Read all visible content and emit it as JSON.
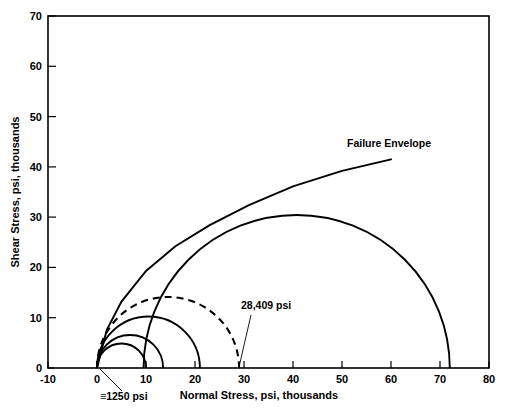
{
  "chart_data": {
    "type": "line",
    "title": "",
    "xlabel": "Normal Stress, psi, thousands",
    "ylabel": "Shear Stress, psi, thousands",
    "xlim": [
      -10,
      80
    ],
    "ylim": [
      0,
      70
    ],
    "xticks": [
      -10,
      0,
      10,
      20,
      30,
      40,
      50,
      60,
      70,
      80
    ],
    "xtick_labels": [
      "-10",
      "0",
      "10",
      "20",
      "30",
      "40",
      "50",
      "60",
      "70",
      "80"
    ],
    "yticks": [
      0,
      10,
      20,
      30,
      40,
      50,
      60,
      70
    ],
    "ytick_labels": [
      "0",
      "10",
      "20",
      "30",
      "40",
      "50",
      "60",
      "70"
    ],
    "grid": false,
    "legend": "none",
    "series": [
      {
        "name": "Mohr circle 1",
        "style": "solid",
        "type": "mohr-circle",
        "sigma_min": 0.0,
        "sigma_max": 10.0,
        "center": 5.0,
        "radius": 5.0
      },
      {
        "name": "Mohr circle 2",
        "style": "solid",
        "type": "mohr-circle",
        "sigma_min": 0.0,
        "sigma_max": 13.5,
        "center": 6.75,
        "radius": 6.75
      },
      {
        "name": "Mohr circle 3",
        "style": "solid",
        "type": "mohr-circle",
        "sigma_min": 0.0,
        "sigma_max": 21.0,
        "center": 10.5,
        "radius": 10.5
      },
      {
        "name": "Mohr circle 4 (28,409 psi)",
        "style": "dashed",
        "type": "mohr-circle",
        "sigma_min": 0.0,
        "sigma_max": 29.0,
        "center": 14.5,
        "radius": 14.5
      },
      {
        "name": "Mohr circle 5",
        "style": "solid",
        "type": "mohr-circle",
        "sigma_min": 9.5,
        "sigma_max": 72.0,
        "center": 40.75,
        "radius": 31.25
      },
      {
        "name": "Failure Envelope",
        "style": "solid",
        "type": "envelope",
        "points": [
          [
            0.0,
            0.0
          ],
          [
            2.0,
            7.6
          ],
          [
            5.0,
            13.2
          ],
          [
            10.0,
            19.3
          ],
          [
            16.0,
            24.2
          ],
          [
            23.0,
            28.4
          ],
          [
            31.0,
            32.4
          ],
          [
            40.0,
            36.1
          ],
          [
            50.0,
            39.2
          ],
          [
            60.0,
            41.5
          ]
        ]
      }
    ],
    "annotations": [
      {
        "name": "failure-envelope-label",
        "text": "Failure Envelope",
        "x": 44.5,
        "y": 43.5
      },
      {
        "name": "cohesion-label",
        "text": "≡1250 psi",
        "x": 4.0,
        "y": -4.6,
        "points_to": [
          0.6,
          0.0
        ]
      },
      {
        "name": "confining-pressure-label",
        "text": "28,409 psi",
        "x": 28.0,
        "y": 8.6,
        "points_to": [
          29.0,
          0.0
        ]
      }
    ]
  },
  "axes": {
    "x_title": "Normal Stress, psi, thousands",
    "y_title": "Shear Stress, psi, thousands"
  }
}
